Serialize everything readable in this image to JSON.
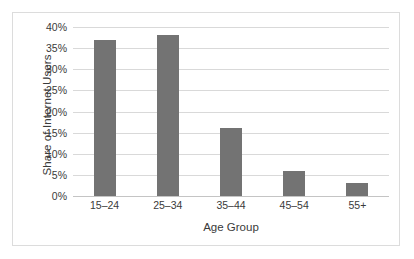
{
  "chart_data": {
    "type": "bar",
    "title": "",
    "subtitle": "",
    "xlabel": "Age Group",
    "ylabel": "Share of Internet Users",
    "categories": [
      "15–24",
      "25–34",
      "35–44",
      "45–54",
      "55+"
    ],
    "values": [
      37,
      38,
      16,
      6,
      3
    ],
    "series": [
      {
        "name": "Share of Internet Users",
        "values": [
          37,
          38,
          16,
          6,
          3
        ]
      }
    ],
    "ylim": [
      0,
      40
    ],
    "ytick_values": [
      0,
      5,
      10,
      15,
      20,
      25,
      30,
      35,
      40
    ],
    "ytick_labels": [
      "0%",
      "5%",
      "10%",
      "15%",
      "20%",
      "25%",
      "30%",
      "35%",
      "40%"
    ],
    "value_suffix": "%",
    "grid": true,
    "grid_axis": "y",
    "legend": false,
    "legend_position": "none",
    "bar_color": "#737373",
    "grid_color": "#d9d9d9",
    "axis_color": "#c4c4c4",
    "text_color": "#3a3a3a",
    "background_color": "#ffffff",
    "border_color": "#dcdcdc",
    "annotations": []
  }
}
